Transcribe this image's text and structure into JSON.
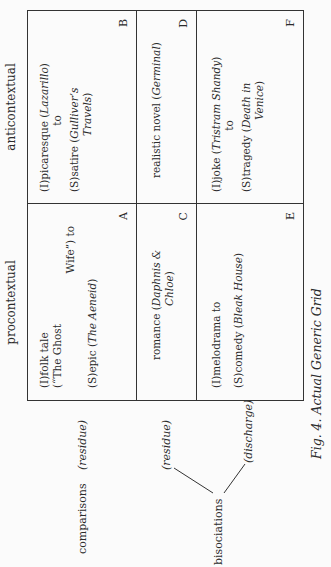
{
  "figure": {
    "caption": "Fig. 4. Actual Generic Grid",
    "columns": [
      {
        "label": "procontextual"
      },
      {
        "label": "anticontextual"
      }
    ],
    "rows": [
      {
        "label": "comparisons",
        "sublabel": "(residue)"
      },
      {
        "label": "bisociations",
        "branches": [
          "(residue)",
          "(discharge)"
        ]
      }
    ],
    "cells": {
      "A": {
        "letter": "A",
        "lines": [
          "(I)folk tale",
          "(“The Ghost",
          "Wife”) to",
          "(S)epic (",
          "The Aeneid",
          ")"
        ]
      },
      "B": {
        "letter": "B",
        "l1_pre": "(I)picaresque (",
        "l1_title": "Lazarillo",
        "l1_post": ")",
        "l2": "to",
        "l3_pre": "(S)satire (",
        "l3_title": "Gulliver’s",
        "l4_title": "Travels",
        "l4_post": ")"
      },
      "C": {
        "letter": "C",
        "l1_pre": "romance (",
        "l1_title": "Daphnis &",
        "l2_title": "Chloe",
        "l2_post": ")"
      },
      "D": {
        "letter": "D",
        "l1_pre": "realistic novel (",
        "l1_title": "Germinal",
        "l1_post": ")"
      },
      "E": {
        "letter": "E",
        "l1": "(I)melodrama to",
        "l2_pre": "(S)comedy (",
        "l2_title": "Bleak House",
        "l2_post": ")"
      },
      "F": {
        "letter": "F",
        "l1_pre": "(I)joke (",
        "l1_title": "Tristram Shandy",
        "l1_post": ")",
        "l2": "to",
        "l3_pre": "(S)tragedy (",
        "l3_title": "Death in",
        "l4_title": "Venice",
        "l4_post": ")"
      }
    }
  }
}
